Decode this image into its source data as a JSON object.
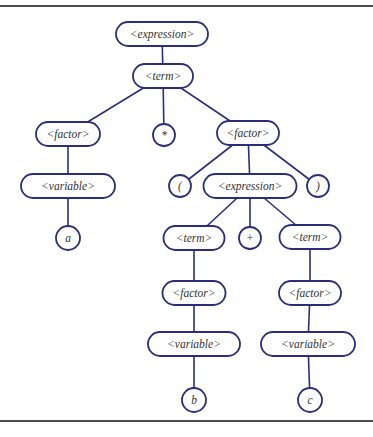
{
  "diagram": {
    "type": "parse-tree",
    "colors": {
      "line": "#2b2f7a",
      "text": "#333333",
      "rule": "#4a4a52"
    },
    "nodes": [
      {
        "id": "expr1",
        "label": "<expression>",
        "shape": "pill",
        "cx": 162,
        "cy": 34,
        "w": 92,
        "h": 24
      },
      {
        "id": "term1",
        "label": "<term>",
        "shape": "pill",
        "cx": 163,
        "cy": 76,
        "w": 60,
        "h": 24
      },
      {
        "id": "factorL",
        "label": "<factor>",
        "shape": "pill",
        "cx": 68,
        "cy": 134,
        "w": 64,
        "h": 24
      },
      {
        "id": "star",
        "label": "*",
        "shape": "circle",
        "cx": 164,
        "cy": 135,
        "r": 11
      },
      {
        "id": "factorR",
        "label": "<factor>",
        "shape": "pill",
        "cx": 248,
        "cy": 133,
        "w": 62,
        "h": 24
      },
      {
        "id": "varL",
        "label": "<variable>",
        "shape": "pill",
        "cx": 68,
        "cy": 186,
        "w": 94,
        "h": 24
      },
      {
        "id": "lparen",
        "label": "(",
        "shape": "circle",
        "cx": 180,
        "cy": 186,
        "r": 11
      },
      {
        "id": "expr2",
        "label": "<expression>",
        "shape": "pill",
        "cx": 250,
        "cy": 186,
        "w": 93,
        "h": 24
      },
      {
        "id": "rparen",
        "label": ")",
        "shape": "circle",
        "cx": 318,
        "cy": 186,
        "r": 11
      },
      {
        "id": "a",
        "label": "a",
        "shape": "circle",
        "cx": 68,
        "cy": 238,
        "r": 12
      },
      {
        "id": "termL",
        "label": "<term>",
        "shape": "pill",
        "cx": 194,
        "cy": 238,
        "w": 61,
        "h": 24
      },
      {
        "id": "plus",
        "label": "+",
        "shape": "circle",
        "cx": 250,
        "cy": 238,
        "r": 11
      },
      {
        "id": "termR",
        "label": "<term>",
        "shape": "pill",
        "cx": 310,
        "cy": 237,
        "w": 61,
        "h": 24
      },
      {
        "id": "factorLL",
        "label": "<factor>",
        "shape": "pill",
        "cx": 194,
        "cy": 293,
        "w": 63,
        "h": 24
      },
      {
        "id": "factorRR",
        "label": "<factor>",
        "shape": "pill",
        "cx": 310,
        "cy": 293,
        "w": 62,
        "h": 24
      },
      {
        "id": "varLL",
        "label": "<variable>",
        "shape": "pill",
        "cx": 194,
        "cy": 344,
        "w": 92,
        "h": 24
      },
      {
        "id": "varRR",
        "label": "<variable>",
        "shape": "pill",
        "cx": 308,
        "cy": 344,
        "w": 94,
        "h": 24
      },
      {
        "id": "b",
        "label": "b",
        "shape": "circle",
        "cx": 194,
        "cy": 400,
        "r": 12
      },
      {
        "id": "c",
        "label": "c",
        "shape": "circle",
        "cx": 310,
        "cy": 400,
        "r": 12
      }
    ],
    "edges": [
      [
        "expr1",
        "term1"
      ],
      [
        "term1",
        "factorL"
      ],
      [
        "term1",
        "star"
      ],
      [
        "term1",
        "factorR"
      ],
      [
        "factorL",
        "varL"
      ],
      [
        "varL",
        "a"
      ],
      [
        "factorR",
        "lparen"
      ],
      [
        "factorR",
        "expr2"
      ],
      [
        "factorR",
        "rparen"
      ],
      [
        "expr2",
        "termL"
      ],
      [
        "expr2",
        "plus"
      ],
      [
        "expr2",
        "termR"
      ],
      [
        "termL",
        "factorLL"
      ],
      [
        "factorLL",
        "varLL"
      ],
      [
        "varLL",
        "b"
      ],
      [
        "termR",
        "factorRR"
      ],
      [
        "factorRR",
        "varRR"
      ],
      [
        "varRR",
        "c"
      ]
    ]
  }
}
